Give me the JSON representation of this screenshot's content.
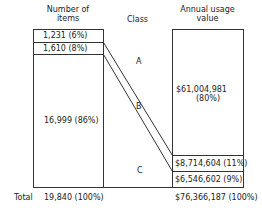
{
  "headers": {
    "items_line1": "Number of",
    "items_line2": "items",
    "class": "Class",
    "value_line1": "Annual usage",
    "value_line2": "value"
  },
  "items": {
    "a": "1,231 (6%)",
    "b": "1,610 (8%)",
    "c": "16,999 (86%)"
  },
  "classes": {
    "a": "A",
    "b": "B",
    "c": "C"
  },
  "values": {
    "a_line1": "$61,004,981",
    "a_line2": "(80%)",
    "b": "$8,714,604 (11%)",
    "c": "$6,546,602 (9%)"
  },
  "totals": {
    "label": "Total",
    "items": "19,840 (100%)",
    "value": "$76,366,187 (100%)"
  },
  "colors": {
    "line": "#333333",
    "text": "#222222"
  }
}
